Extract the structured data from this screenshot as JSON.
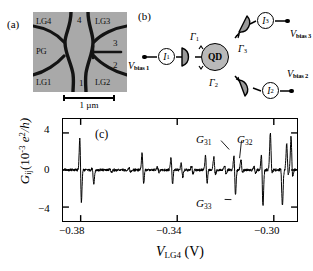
{
  "panels": {
    "a_tag": "(a)",
    "b_tag": "(b)",
    "c_tag": "(c)"
  },
  "sem": {
    "gate_labels": [
      {
        "name": "LG4",
        "pos": "top-left"
      },
      {
        "name": "LG3",
        "pos": "top-right"
      },
      {
        "name": "PG",
        "pos": "mid-left"
      },
      {
        "name": "LG1",
        "pos": "bottom-left"
      },
      {
        "name": "LG2",
        "pos": "bottom-right"
      }
    ],
    "region_numbers": [
      "1",
      "2",
      "3",
      "4"
    ],
    "scalebar_text": "1 µm",
    "background_color": "#a9a9a9",
    "gate_color": "#141414"
  },
  "circuit": {
    "dot_label": "QD",
    "dot_color": "#b9b9b9",
    "meters": [
      {
        "symbol": "I",
        "index": "1"
      },
      {
        "symbol": "I",
        "index": "2"
      },
      {
        "symbol": "I",
        "index": "3"
      }
    ],
    "bias_labels": [
      {
        "symbol": "V",
        "sub": "bias 1"
      },
      {
        "symbol": "V",
        "sub": "bias 2"
      },
      {
        "symbol": "V",
        "sub": "bias 3"
      }
    ],
    "barriers": [
      {
        "symbol": "Γ",
        "index": "1"
      },
      {
        "symbol": "Γ",
        "index": "2"
      },
      {
        "symbol": "Γ",
        "index": "3"
      }
    ]
  },
  "chart_data": {
    "type": "line",
    "title": "",
    "xlabel": "V_LG4 (V)",
    "xlabel_symbol": "V",
    "xlabel_sub": "LG4",
    "xlabel_unit": "(V)",
    "ylabel": "G_ij (10^-3 e^2/h)",
    "ylabel_symbol": "G",
    "ylabel_sub": "ij",
    "ylabel_unit_pre": "(10",
    "ylabel_unit_exp": "-3",
    "ylabel_unit_post": " e",
    "ylabel_unit_exp2": "2",
    "ylabel_unit_tail": "/h)",
    "xlim": [
      -0.3925,
      -0.2955
    ],
    "ylim": [
      -5.6,
      5.6
    ],
    "xticks": [
      -0.38,
      -0.34,
      -0.3
    ],
    "xtick_labels": [
      "−0.38",
      "−0.34",
      "−0.30"
    ],
    "yticks": [
      4,
      0,
      -4
    ],
    "ytick_labels": [
      "4",
      "0",
      "−4"
    ],
    "grid": false,
    "legend": false,
    "line_color": "#000000",
    "annotations": [
      {
        "text": "G31",
        "symbol": "G",
        "sub": "31",
        "x": -0.3236,
        "y": 2.0
      },
      {
        "text": "G32",
        "symbol": "G",
        "sub": "32",
        "x": -0.3193,
        "y": 1.5
      },
      {
        "text": "G33",
        "symbol": "G",
        "sub": "33",
        "x": -0.3227,
        "y": -3.4
      }
    ],
    "resonances": [
      {
        "x": -0.3852,
        "pos": 4.35,
        "neg": -4.45
      },
      {
        "x": -0.38,
        "pos": 0.3,
        "neg": -1.55
      },
      {
        "x": -0.3727,
        "pos": 0.22,
        "neg": -0.3
      },
      {
        "x": -0.3648,
        "pos": 0.35,
        "neg": -0.35
      },
      {
        "x": -0.3594,
        "pos": 2.35,
        "neg": -1.95
      },
      {
        "x": -0.353,
        "pos": 0.4,
        "neg": -0.4
      },
      {
        "x": -0.3474,
        "pos": 1.75,
        "neg": -1.9
      },
      {
        "x": -0.3432,
        "pos": 0.95,
        "neg": -0.95
      },
      {
        "x": -0.3389,
        "pos": 0.55,
        "neg": -0.55
      },
      {
        "x": -0.3331,
        "pos": 1.95,
        "neg": -1.85
      },
      {
        "x": -0.3297,
        "pos": 1.6,
        "neg": -0.8
      },
      {
        "x": -0.3252,
        "pos": 0.6,
        "neg": -0.6
      },
      {
        "x": -0.3213,
        "pos": 2.25,
        "neg": -3.25
      },
      {
        "x": -0.3185,
        "pos": 1.3,
        "neg": -0.45
      },
      {
        "x": -0.313,
        "pos": 0.45,
        "neg": -0.45
      },
      {
        "x": -0.3099,
        "pos": 2.6,
        "neg": -4.6
      },
      {
        "x": -0.3063,
        "pos": 4.3,
        "neg": -0.7
      },
      {
        "x": -0.3018,
        "pos": 0.55,
        "neg": -4.1
      },
      {
        "x": -0.2995,
        "pos": 3.1,
        "neg": -0.9
      },
      {
        "x": -0.2977,
        "pos": 3.95,
        "neg": -1.3
      }
    ]
  }
}
